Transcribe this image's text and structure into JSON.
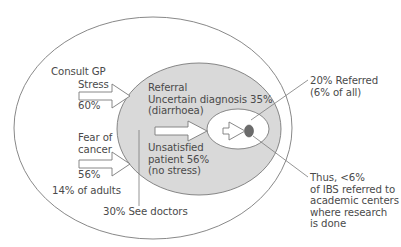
{
  "colors": {
    "outline": "#7a7a7a",
    "gray_fill": "#d9d9d9",
    "inner_fill": "#ffffff",
    "dot_fill": "#6b6b6b",
    "text": "#4a4a4a"
  },
  "outer": {
    "label": "Consult GP",
    "stress": {
      "label": "Stress",
      "value": "60%"
    },
    "fear": {
      "line1": "Fear of",
      "line2": "cancer",
      "value": "56%"
    },
    "adults": "14% of adults",
    "see_doctors": "30% See doctors"
  },
  "middle": {
    "referral": "Referral",
    "uncertain": "Uncertain diagnosis 35%",
    "diarrhoea": "(diarrhoea)",
    "unsatisfied": "Unsatisfied",
    "patient": "patient 56%",
    "no_stress": "(no stress)"
  },
  "inner": {
    "referred": "20% Referred",
    "of_all": "(6% of all)"
  },
  "core": {
    "line1": "Thus, <6%",
    "line2": "of IBS referred to",
    "line3": "academic centers",
    "line4": "where research",
    "line5": "is done"
  }
}
